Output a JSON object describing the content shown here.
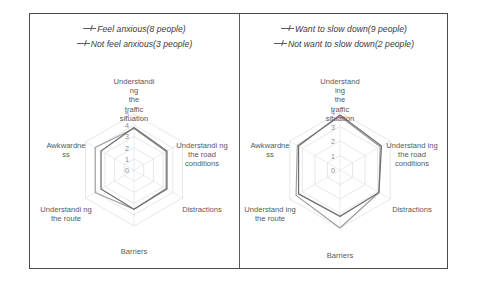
{
  "figure": {
    "border_color": "#4a4a4a",
    "divider_color": "#5a5a5a"
  },
  "panels": [
    {
      "id": "left",
      "legend": [
        {
          "label": "Feel anxious(8 people)",
          "marker": "line-marker-icon",
          "color": "#6f6f6f"
        },
        {
          "label": "Not feel anxious(3 people)",
          "marker": "line-marker-icon",
          "color": "#9a9a9a"
        }
      ],
      "chart_data": {
        "type": "radar",
        "title": "",
        "categories": [
          "Understandi ng the traffic situation",
          "Understandi ng the road conditions",
          "Distractions",
          "Barriers",
          "Understandi ng the route",
          "Awkwardne ss"
        ],
        "tick_labels": [
          "0",
          "1",
          "2",
          "3",
          "4",
          "5"
        ],
        "rlim": [
          0,
          5
        ],
        "grid": true,
        "legend_position": "top",
        "series": [
          {
            "name": "Feel anxious(8 people)",
            "color": "#6f6f6f",
            "values": [
              3.8,
              3.4,
              3.4,
              3.5,
              3.4,
              3.4
            ]
          },
          {
            "name": "Not feel anxious(3 people)",
            "color": "#9a9a9a",
            "values": [
              3.7,
              3.3,
              3.3,
              3.5,
              4.0,
              4.0
            ]
          }
        ]
      }
    },
    {
      "id": "right",
      "legend": [
        {
          "label": "Want to slow down(9 people)",
          "marker": "line-marker-icon",
          "color": "#6f6f6f"
        },
        {
          "label": "Not want to slow down(2 people)",
          "marker": "line-marker-icon",
          "color": "#9a9a9a"
        }
      ],
      "chart_data": {
        "type": "radar",
        "title": "",
        "categories": [
          "Understand ing the traffic situation",
          "Understand ing the road conditions",
          "Distractions",
          "Barriers",
          "Understand ing the route",
          "Awkwardne ss"
        ],
        "tick_labels": [
          "0",
          "1",
          "2",
          "3",
          "4"
        ],
        "rlim": [
          0,
          4
        ],
        "grid": true,
        "legend_position": "top",
        "series": [
          {
            "name": "Want to slow down(9 people)",
            "color": "#6f6f6f",
            "values": [
              3.8,
              3.3,
              3.1,
              3.2,
              3.3,
              3.3
            ]
          },
          {
            "name": "Not want to slow down(2 people)",
            "color": "#9a9a9a",
            "values": [
              3.7,
              3.2,
              3.1,
              4.0,
              3.5,
              3.4
            ]
          }
        ]
      }
    }
  ]
}
